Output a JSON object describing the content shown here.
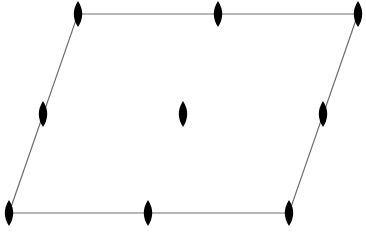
{
  "diagram": {
    "type": "2D lattice unit cell with 2-fold rotation axes",
    "shape": "parallelogram",
    "colors": {
      "background": "#ffffff",
      "edge": "#6e6e6e",
      "symbol": "#000000"
    },
    "cell_vertices": [
      {
        "name": "top-left",
        "x": 78,
        "y": 14
      },
      {
        "name": "top-right",
        "x": 358,
        "y": 14
      },
      {
        "name": "bottom-right",
        "x": 289,
        "y": 213
      },
      {
        "name": "bottom-left",
        "x": 9,
        "y": 213
      }
    ],
    "symbol": {
      "kind": "twofold-axis-lens",
      "rx": 4.2,
      "ry": 13
    },
    "symbols": [
      {
        "name": "corner-top-left",
        "x": 78,
        "y": 14
      },
      {
        "name": "edge-mid-top",
        "x": 218,
        "y": 14
      },
      {
        "name": "corner-top-right",
        "x": 358,
        "y": 14
      },
      {
        "name": "edge-mid-left",
        "x": 43,
        "y": 114
      },
      {
        "name": "cell-center",
        "x": 183,
        "y": 114
      },
      {
        "name": "edge-mid-right",
        "x": 323,
        "y": 114
      },
      {
        "name": "corner-bottom-left",
        "x": 9,
        "y": 213
      },
      {
        "name": "edge-mid-bottom",
        "x": 148,
        "y": 213
      },
      {
        "name": "corner-bottom-right",
        "x": 289,
        "y": 213
      }
    ]
  }
}
